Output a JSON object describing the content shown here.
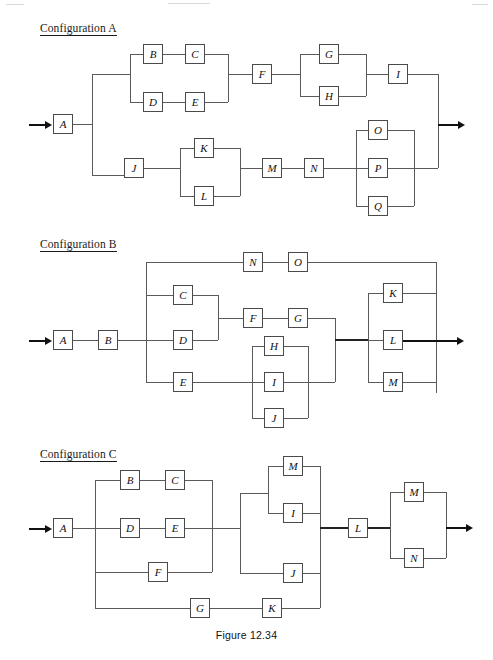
{
  "figure": {
    "caption": "Figure 12.34",
    "type": "reliability-block-diagram",
    "line_color": "#5a5a5a",
    "box_border_color": "#4a4a4a",
    "text_color": "#111111",
    "background": "#ffffff"
  },
  "configurations": [
    {
      "id": "a",
      "title": "Configuration A",
      "blocks": [
        {
          "label": "A",
          "x": 53,
          "y": 114
        },
        {
          "label": "B",
          "x": 143,
          "y": 44
        },
        {
          "label": "C",
          "x": 185,
          "y": 44
        },
        {
          "label": "D",
          "x": 143,
          "y": 92
        },
        {
          "label": "E",
          "x": 185,
          "y": 92
        },
        {
          "label": "F",
          "x": 252,
          "y": 64
        },
        {
          "label": "G",
          "x": 319,
          "y": 44
        },
        {
          "label": "H",
          "x": 319,
          "y": 86
        },
        {
          "label": "I",
          "x": 388,
          "y": 64
        },
        {
          "label": "J",
          "x": 124,
          "y": 158
        },
        {
          "label": "K",
          "x": 194,
          "y": 138
        },
        {
          "label": "L",
          "x": 194,
          "y": 186
        },
        {
          "label": "M",
          "x": 262,
          "y": 158
        },
        {
          "label": "N",
          "x": 304,
          "y": 158
        },
        {
          "label": "O",
          "x": 368,
          "y": 120
        },
        {
          "label": "P",
          "x": 368,
          "y": 158
        },
        {
          "label": "Q",
          "x": 368,
          "y": 196
        }
      ]
    },
    {
      "id": "b",
      "title": "Configuration B",
      "blocks": [
        {
          "label": "A",
          "x": 53,
          "y": 330
        },
        {
          "label": "B",
          "x": 98,
          "y": 330
        },
        {
          "label": "C",
          "x": 173,
          "y": 285
        },
        {
          "label": "D",
          "x": 173,
          "y": 330
        },
        {
          "label": "E",
          "x": 173,
          "y": 372
        },
        {
          "label": "F",
          "x": 243,
          "y": 308
        },
        {
          "label": "G",
          "x": 288,
          "y": 308
        },
        {
          "label": "H",
          "x": 264,
          "y": 336
        },
        {
          "label": "I",
          "x": 264,
          "y": 372
        },
        {
          "label": "J",
          "x": 264,
          "y": 408
        },
        {
          "label": "K",
          "x": 383,
          "y": 283
        },
        {
          "label": "L",
          "x": 383,
          "y": 330
        },
        {
          "label": "M",
          "x": 383,
          "y": 372
        },
        {
          "label": "N",
          "x": 243,
          "y": 252
        },
        {
          "label": "O",
          "x": 288,
          "y": 252
        }
      ]
    },
    {
      "id": "c",
      "title": "Configuration C",
      "blocks": [
        {
          "label": "A",
          "x": 53,
          "y": 518
        },
        {
          "label": "B",
          "x": 120,
          "y": 470
        },
        {
          "label": "C",
          "x": 165,
          "y": 470
        },
        {
          "label": "D",
          "x": 120,
          "y": 518
        },
        {
          "label": "E",
          "x": 165,
          "y": 518
        },
        {
          "label": "F",
          "x": 148,
          "y": 562
        },
        {
          "label": "G",
          "x": 190,
          "y": 598
        },
        {
          "label": "K",
          "x": 262,
          "y": 598
        },
        {
          "label": "M",
          "x": 283,
          "y": 456
        },
        {
          "label": "I",
          "x": 283,
          "y": 503
        },
        {
          "label": "J",
          "x": 283,
          "y": 563
        },
        {
          "label": "L",
          "x": 348,
          "y": 518
        },
        {
          "label": "M2",
          "x": 404,
          "y": 482
        },
        {
          "label": "N",
          "x": 404,
          "y": 548
        }
      ],
      "block_labels": {
        "M2": "M"
      }
    }
  ]
}
